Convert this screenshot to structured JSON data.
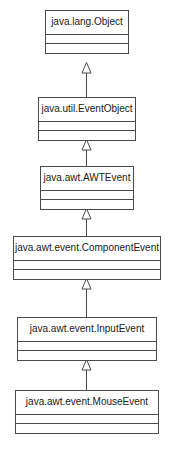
{
  "diagram": {
    "kind": "uml-class-diagram",
    "width": 173,
    "height": 458,
    "background_color": "#ffffff",
    "line_color": "#4a4a4a",
    "text_color": "#1a1a1a",
    "classes": [
      {
        "id": "java-lang-object",
        "name": "java.lang.Object",
        "x": 45,
        "y": 10,
        "width": 84,
        "compartments": [
          "attributes",
          "operations"
        ]
      },
      {
        "id": "java-util-eventobject",
        "name": "java.util.EventObject",
        "x": 38,
        "y": 97,
        "width": 98,
        "compartments": [
          "attributes",
          "operations"
        ]
      },
      {
        "id": "java-awt-awtevent",
        "name": "java.awt.AWTEvent",
        "x": 40,
        "y": 166,
        "width": 94,
        "compartments": [
          "attributes",
          "operations"
        ]
      },
      {
        "id": "java-awt-event-componentevent",
        "name": "java.awt.event.ComponentEvent",
        "x": 13,
        "y": 236,
        "width": 148,
        "compartments": [
          "attributes",
          "operations"
        ]
      },
      {
        "id": "java-awt-event-inputevent",
        "name": "java.awt.event.InputEvent",
        "x": 17,
        "y": 317,
        "width": 140,
        "compartments": [
          "attributes",
          "operations"
        ]
      },
      {
        "id": "java-awt-event-mouseevent",
        "name": "java.awt.event.MouseEvent",
        "x": 15,
        "y": 390,
        "width": 144,
        "compartments": [
          "attributes",
          "operations"
        ]
      }
    ],
    "generalizations": [
      {
        "id": "gen-eventobject-to-object",
        "from": "java-util-eventobject",
        "to": "java-lang-object",
        "arrow": "hollow-triangle",
        "x": 78,
        "y": 62,
        "height": 35
      },
      {
        "id": "gen-awtevent-to-eventobject",
        "from": "java-awt-awtevent",
        "to": "java-util-eventobject",
        "arrow": "hollow-triangle",
        "x": 78,
        "y": 139,
        "height": 27
      },
      {
        "id": "gen-componentevent-to-awtevent",
        "from": "java-awt-event-componentevent",
        "to": "java-awt-awtevent",
        "arrow": "hollow-triangle",
        "x": 78,
        "y": 208,
        "height": 28
      },
      {
        "id": "gen-inputevent-to-componentevent",
        "from": "java-awt-event-inputevent",
        "to": "java-awt-event-componentevent",
        "arrow": "hollow-triangle",
        "x": 78,
        "y": 278,
        "height": 39
      },
      {
        "id": "gen-mouseevent-to-inputevent",
        "from": "java-awt-event-mouseevent",
        "to": "java-awt-event-inputevent",
        "arrow": "hollow-triangle",
        "x": 78,
        "y": 359,
        "height": 31
      }
    ]
  }
}
